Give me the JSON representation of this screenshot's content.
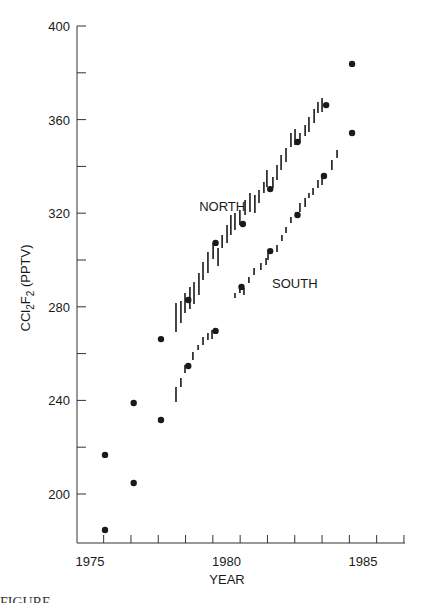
{
  "chart_data": {
    "type": "scatter",
    "title": "",
    "xlabel": "YEAR",
    "ylabel": "CCl2F2 (PPTV)",
    "ylabel_parts": {
      "main": "CCl",
      "sub1": "2",
      "mid": "F",
      "sub2": "2",
      "unit": " (PPTV)"
    },
    "xlim": [
      1974.5,
      1986.55
    ],
    "ylim": [
      180,
      400
    ],
    "x_ticks_major": [
      1975,
      1980,
      1985
    ],
    "x_tick_labels": [
      "1975",
      "1980",
      "1985"
    ],
    "x_ticks_minor_midyear": [
      1975.5,
      1976.5,
      1977.5,
      1978.5,
      1979.5,
      1980.5,
      1981.5,
      1982.5,
      1983.5,
      1984.5,
      1985.5,
      1986.5
    ],
    "y_ticks": [
      200,
      220,
      240,
      260,
      280,
      300,
      320,
      340,
      360,
      380,
      400
    ],
    "y_tick_labels": {
      "200": "200",
      "240": "240",
      "280": "280",
      "320": "320",
      "360": "360",
      "400": "400"
    },
    "grid": false,
    "legend": "none (series labeled inline)",
    "series": [
      {
        "name": "NORTH",
        "label_pos": [
          1979.0,
          323
        ],
        "annual_means": [
          [
            1975.55,
            216.7
          ],
          [
            1976.6,
            238.9
          ],
          [
            1977.6,
            266.2
          ],
          [
            1978.6,
            282.9
          ],
          [
            1979.6,
            307.3
          ],
          [
            1980.6,
            315.4
          ],
          [
            1981.6,
            330.3
          ],
          [
            1982.6,
            350.4
          ],
          [
            1983.65,
            366.2
          ],
          [
            1984.6,
            383.8
          ]
        ],
        "monthly_ranges": [
          [
            1978.15,
            269.2,
            281.6
          ],
          [
            1978.33,
            273.1,
            282.5
          ],
          [
            1978.48,
            277.4,
            285.9
          ],
          [
            1978.66,
            279.1,
            288.5
          ],
          [
            1978.81,
            281.2,
            290.6
          ],
          [
            1978.99,
            285.0,
            294.4
          ],
          [
            1979.14,
            291.5,
            299.1
          ],
          [
            1979.32,
            294.4,
            303.4
          ],
          [
            1979.51,
            300.4,
            307.3
          ],
          [
            1979.69,
            297.4,
            305.1
          ],
          [
            1979.84,
            305.1,
            310.7
          ],
          [
            1980.02,
            307.3,
            315.0
          ],
          [
            1980.16,
            310.7,
            319.2
          ],
          [
            1980.31,
            312.8,
            320.1
          ],
          [
            1980.49,
            315.0,
            321.4
          ],
          [
            1980.68,
            319.2,
            325.6
          ],
          [
            1980.86,
            320.5,
            328.6
          ],
          [
            1981.04,
            320.1,
            327.8
          ],
          [
            1981.19,
            324.4,
            329.9
          ],
          [
            1981.37,
            328.6,
            333.3
          ],
          [
            1981.48,
            331.2,
            338.5
          ],
          [
            1981.7,
            330.8,
            335.5
          ],
          [
            1981.85,
            334.2,
            340.6
          ],
          [
            1982.0,
            338.5,
            344.9
          ],
          [
            1982.18,
            341.9,
            347.9
          ],
          [
            1982.36,
            348.3,
            354.3
          ],
          [
            1982.51,
            349.1,
            356.0
          ],
          [
            1982.69,
            350.0,
            354.3
          ],
          [
            1982.88,
            353.0,
            357.7
          ],
          [
            1983.02,
            354.7,
            361.1
          ],
          [
            1983.21,
            358.5,
            364.5
          ],
          [
            1983.35,
            362.8,
            367.5
          ],
          [
            1983.5,
            363.2,
            369.2
          ]
        ]
      },
      {
        "name": "SOUTH",
        "label_pos": [
          1981.67,
          290
        ],
        "annual_means": [
          [
            1975.55,
            184.6
          ],
          [
            1976.6,
            204.7
          ],
          [
            1977.6,
            231.6
          ],
          [
            1978.6,
            254.7
          ],
          [
            1979.6,
            269.7
          ],
          [
            1980.55,
            288.5
          ],
          [
            1981.6,
            303.8
          ],
          [
            1982.6,
            319.2
          ],
          [
            1983.57,
            335.9
          ],
          [
            1984.6,
            354.3
          ]
        ],
        "monthly_ranges": [
          [
            1978.15,
            239.3,
            245.7
          ],
          [
            1978.33,
            245.7,
            249.6
          ],
          [
            1978.48,
            251.7,
            255.1
          ],
          [
            1978.77,
            257.3,
            260.7
          ],
          [
            1978.96,
            261.5,
            263.7
          ],
          [
            1979.14,
            263.7,
            267.1
          ],
          [
            1979.32,
            265.8,
            268.8
          ],
          [
            1979.47,
            266.2,
            270.1
          ],
          [
            1980.31,
            283.8,
            285.9
          ],
          [
            1980.49,
            285.9,
            288.5
          ],
          [
            1980.64,
            285.0,
            288.0
          ],
          [
            1980.82,
            290.2,
            292.7
          ],
          [
            1981.01,
            293.6,
            296.6
          ],
          [
            1981.26,
            295.7,
            298.7
          ],
          [
            1981.45,
            297.9,
            300.9
          ],
          [
            1981.52,
            300.0,
            303.0
          ],
          [
            1981.85,
            303.4,
            306.4
          ],
          [
            1982.03,
            308.1,
            310.7
          ],
          [
            1982.18,
            311.5,
            314.1
          ],
          [
            1982.36,
            315.8,
            318.4
          ],
          [
            1982.55,
            318.4,
            320.5
          ],
          [
            1982.69,
            320.5,
            324.4
          ],
          [
            1982.88,
            322.6,
            326.5
          ],
          [
            1983.02,
            326.5,
            328.6
          ],
          [
            1983.17,
            327.8,
            330.8
          ],
          [
            1983.35,
            330.8,
            334.2
          ],
          [
            1983.5,
            332.1,
            335.5
          ],
          [
            1983.86,
            338.5,
            342.7
          ],
          [
            1984.05,
            343.6,
            347.0
          ]
        ]
      }
    ],
    "colors": {
      "ink": "#1a1a1a",
      "axis": "#333333",
      "background": "#ffffff"
    }
  },
  "layout": {
    "plot_px": {
      "x0_year": 1975,
      "x0_px": 90,
      "px_per_year": 27.3,
      "y0_value": 200,
      "y0_px": 494,
      "px_per_unit": 2.34,
      "axis_left_px": 77,
      "axis_right_px": 405,
      "axis_top_px": 26,
      "axis_bottom_px": 543
    }
  },
  "caption": {
    "visible_text": "FIGURE"
  }
}
